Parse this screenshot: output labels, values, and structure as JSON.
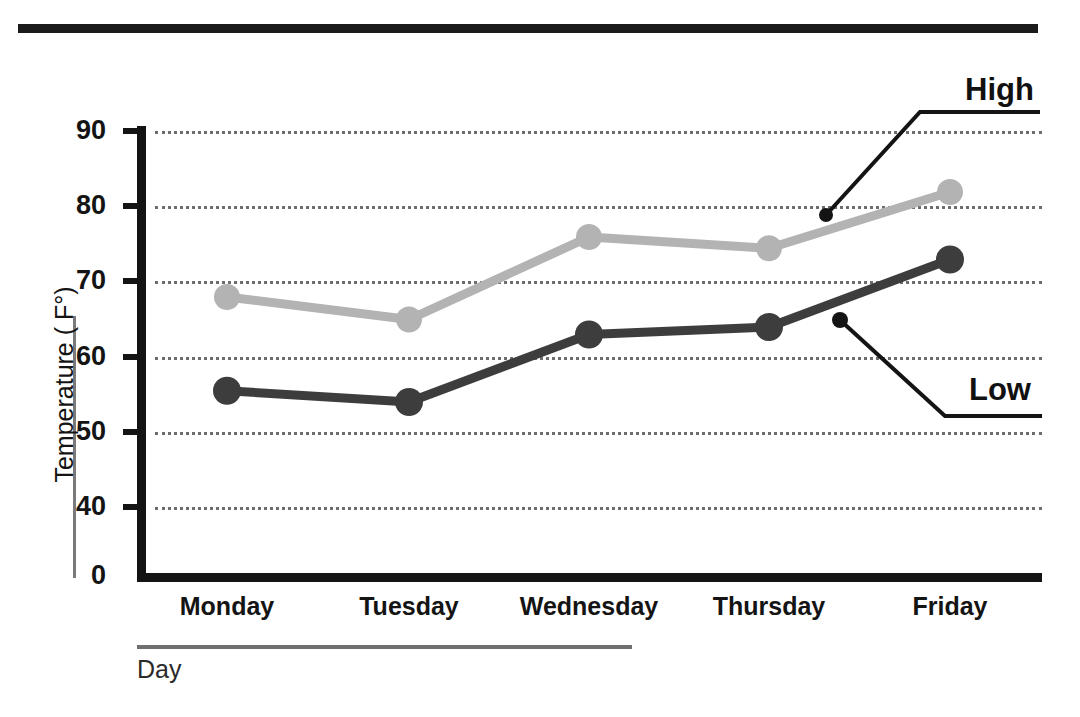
{
  "title": "Daily Temperatures",
  "axis": {
    "ylabel": "Temperature ( F°)",
    "xlabel": "Day"
  },
  "callouts": {
    "high": "High",
    "low": "Low"
  },
  "chart_data": {
    "type": "line",
    "title": "Daily Temperatures",
    "xlabel": "Day",
    "ylabel": "Temperature ( F°)",
    "categories": [
      "Monday",
      "Tuesday",
      "Wednesday",
      "Thursday",
      "Friday"
    ],
    "series": [
      {
        "name": "High",
        "color": "#b3b3b3",
        "values": [
          68,
          65,
          76,
          74.5,
          82
        ]
      },
      {
        "name": "Low",
        "color": "#3d3d3d",
        "values": [
          55.5,
          54,
          63,
          64,
          73
        ]
      }
    ],
    "yticks": [
      0,
      40,
      50,
      60,
      70,
      80,
      90
    ],
    "ytick_labels": [
      "0",
      "40",
      "50",
      "60",
      "70",
      "80",
      "90"
    ],
    "ylim": [
      40,
      90
    ],
    "axis_break": true,
    "grid": true,
    "grid_style": "dotted",
    "legend": "callout-labels"
  }
}
